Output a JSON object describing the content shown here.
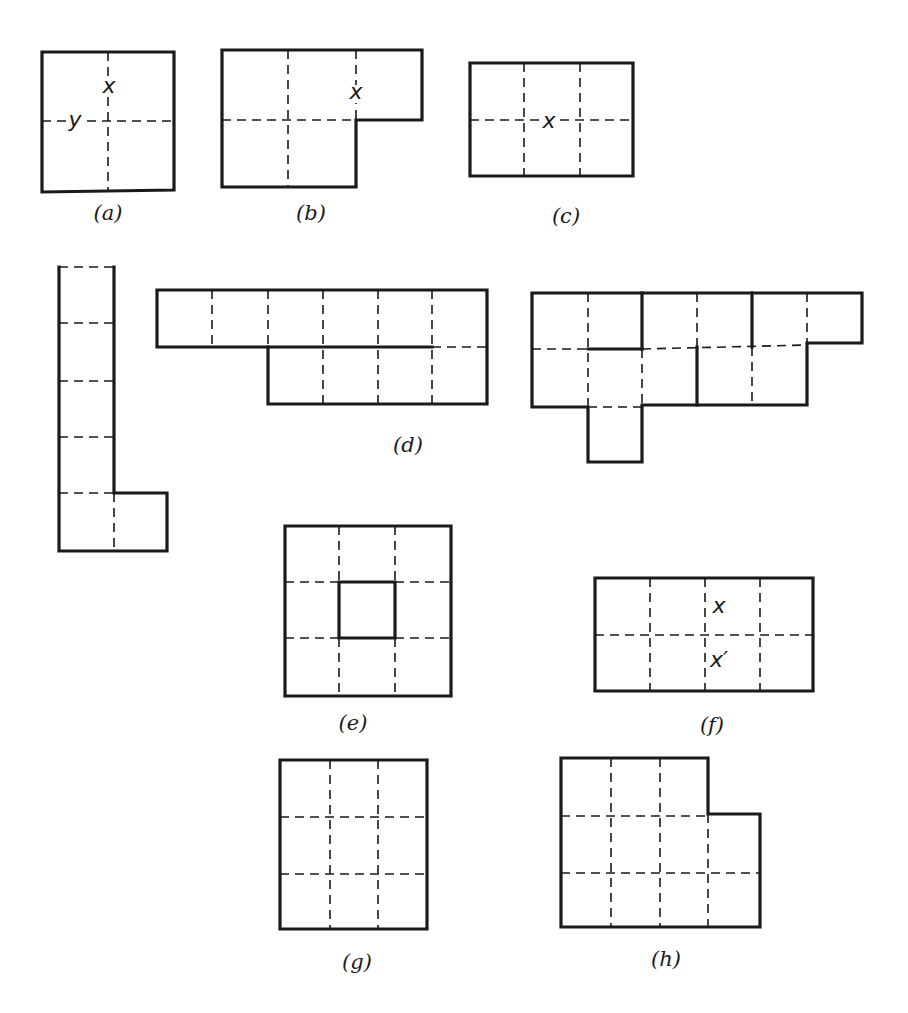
{
  "figures": [
    {
      "id": "a",
      "caption": "(a)",
      "caption_pos": [
        108,
        220
      ],
      "solid": [
        [
          [
            42,
            52
          ],
          [
            174,
            52
          ],
          [
            174,
            190
          ],
          [
            42,
            192
          ],
          [
            42,
            52
          ]
        ]
      ],
      "dashed": [
        [
          [
            108,
            52
          ],
          [
            108,
            190
          ]
        ],
        [
          [
            42,
            121
          ],
          [
            174,
            121
          ]
        ]
      ],
      "labels": [
        {
          "text": "x",
          "pos": [
            109,
            93
          ]
        },
        {
          "text": "y",
          "pos": [
            75,
            127
          ]
        }
      ]
    },
    {
      "id": "b",
      "caption": "(b)",
      "caption_pos": [
        311,
        220
      ],
      "solid": [
        [
          [
            222,
            50
          ],
          [
            422,
            50
          ],
          [
            422,
            120
          ],
          [
            356,
            120
          ],
          [
            356,
            187
          ],
          [
            222,
            187
          ],
          [
            222,
            50
          ]
        ]
      ],
      "dashed": [
        [
          [
            288,
            50
          ],
          [
            288,
            187
          ]
        ],
        [
          [
            356,
            50
          ],
          [
            356,
            120
          ]
        ],
        [
          [
            222,
            120
          ],
          [
            356,
            120
          ]
        ]
      ],
      "labels": [
        {
          "text": "x",
          "pos": [
            356,
            99
          ]
        }
      ]
    },
    {
      "id": "c",
      "caption": "(c)",
      "caption_pos": [
        566,
        223
      ],
      "solid": [
        [
          [
            470,
            63
          ],
          [
            633,
            63
          ],
          [
            633,
            176
          ],
          [
            470,
            176
          ],
          [
            470,
            63
          ]
        ]
      ],
      "dashed": [
        [
          [
            524,
            63
          ],
          [
            524,
            176
          ]
        ],
        [
          [
            580,
            63
          ],
          [
            580,
            176
          ]
        ],
        [
          [
            470,
            120
          ],
          [
            633,
            120
          ]
        ]
      ],
      "labels": [
        {
          "text": "x",
          "pos": [
            549,
            128
          ]
        }
      ]
    },
    {
      "id": "d-left",
      "caption": "",
      "solid": [
        [
          [
            59,
            267
          ],
          [
            59,
            551
          ],
          [
            167,
            551
          ],
          [
            167,
            493
          ],
          [
            114,
            493
          ],
          [
            114,
            267
          ]
        ]
      ],
      "dashed": [
        [
          [
            59,
            267
          ],
          [
            114,
            267
          ]
        ],
        [
          [
            59,
            323
          ],
          [
            114,
            323
          ]
        ],
        [
          [
            59,
            381
          ],
          [
            114,
            381
          ]
        ],
        [
          [
            59,
            437
          ],
          [
            114,
            437
          ]
        ],
        [
          [
            59,
            493
          ],
          [
            114,
            493
          ]
        ],
        [
          [
            114,
            493
          ],
          [
            114,
            551
          ]
        ]
      ],
      "labels": []
    },
    {
      "id": "d-middle",
      "caption": "(d)",
      "caption_pos": [
        408,
        452
      ],
      "solid": [
        [
          [
            157,
            290
          ],
          [
            487,
            290
          ],
          [
            487,
            404
          ],
          [
            268,
            404
          ],
          [
            268,
            347
          ],
          [
            157,
            347
          ],
          [
            157,
            290
          ]
        ],
        [
          [
            268,
            347
          ],
          [
            432,
            347
          ]
        ]
      ],
      "dashed": [
        [
          [
            212,
            290
          ],
          [
            212,
            347
          ]
        ],
        [
          [
            268,
            290
          ],
          [
            268,
            404
          ]
        ],
        [
          [
            323,
            290
          ],
          [
            323,
            404
          ]
        ],
        [
          [
            378,
            290
          ],
          [
            378,
            404
          ]
        ],
        [
          [
            432,
            290
          ],
          [
            432,
            404
          ]
        ],
        [
          [
            432,
            347
          ],
          [
            487,
            347
          ]
        ]
      ],
      "labels": []
    },
    {
      "id": "d-right",
      "caption": "",
      "solid": [
        [
          [
            532,
            293
          ],
          [
            862,
            293
          ],
          [
            862,
            343
          ],
          [
            807,
            343
          ],
          [
            807,
            405
          ],
          [
            642,
            405
          ],
          [
            642,
            462
          ],
          [
            588,
            462
          ],
          [
            588,
            407
          ],
          [
            532,
            407
          ],
          [
            532,
            293
          ]
        ],
        [
          [
            642,
            293
          ],
          [
            642,
            349
          ]
        ],
        [
          [
            588,
            349
          ],
          [
            642,
            349
          ]
        ],
        [
          [
            697,
            347
          ],
          [
            697,
            405
          ]
        ],
        [
          [
            752,
            293
          ],
          [
            752,
            347
          ]
        ]
      ],
      "dashed": [
        [
          [
            588,
            293
          ],
          [
            588,
            407
          ]
        ],
        [
          [
            697,
            293
          ],
          [
            697,
            347
          ]
        ],
        [
          [
            807,
            293
          ],
          [
            807,
            343
          ]
        ],
        [
          [
            532,
            349
          ],
          [
            588,
            349
          ]
        ],
        [
          [
            642,
            349
          ],
          [
            807,
            345
          ]
        ],
        [
          [
            642,
            349
          ],
          [
            642,
            405
          ]
        ],
        [
          [
            752,
            347
          ],
          [
            752,
            405
          ]
        ],
        [
          [
            588,
            407
          ],
          [
            642,
            407
          ]
        ]
      ],
      "labels": []
    },
    {
      "id": "e",
      "caption": "(e)",
      "caption_pos": [
        353,
        730
      ],
      "solid": [
        [
          [
            285,
            526
          ],
          [
            451,
            526
          ],
          [
            451,
            696
          ],
          [
            285,
            696
          ],
          [
            285,
            526
          ]
        ],
        [
          [
            339,
            582
          ],
          [
            395,
            582
          ],
          [
            395,
            638
          ],
          [
            339,
            638
          ],
          [
            339,
            582
          ]
        ]
      ],
      "dashed": [
        [
          [
            339,
            526
          ],
          [
            339,
            582
          ]
        ],
        [
          [
            395,
            526
          ],
          [
            395,
            582
          ]
        ],
        [
          [
            339,
            638
          ],
          [
            339,
            696
          ]
        ],
        [
          [
            395,
            638
          ],
          [
            395,
            696
          ]
        ],
        [
          [
            285,
            582
          ],
          [
            339,
            582
          ]
        ],
        [
          [
            395,
            582
          ],
          [
            451,
            582
          ]
        ],
        [
          [
            285,
            638
          ],
          [
            339,
            638
          ]
        ],
        [
          [
            395,
            638
          ],
          [
            451,
            638
          ]
        ]
      ],
      "labels": []
    },
    {
      "id": "f",
      "caption": "(f)",
      "caption_pos": [
        712,
        732
      ],
      "solid": [
        [
          [
            595,
            578
          ],
          [
            813,
            578
          ],
          [
            813,
            691
          ],
          [
            595,
            691
          ],
          [
            595,
            578
          ]
        ]
      ],
      "dashed": [
        [
          [
            650,
            578
          ],
          [
            650,
            691
          ]
        ],
        [
          [
            705,
            578
          ],
          [
            705,
            691
          ]
        ],
        [
          [
            760,
            578
          ],
          [
            760,
            691
          ]
        ],
        [
          [
            595,
            635
          ],
          [
            813,
            635
          ]
        ]
      ],
      "labels": [
        {
          "text": "x",
          "pos": [
            719,
            613
          ]
        },
        {
          "text": "x′",
          "pos": [
            719,
            667
          ]
        }
      ]
    },
    {
      "id": "g",
      "caption": "(g)",
      "caption_pos": [
        357,
        969
      ],
      "solid": [
        [
          [
            280,
            760
          ],
          [
            427,
            760
          ],
          [
            427,
            929
          ],
          [
            280,
            929
          ],
          [
            280,
            760
          ]
        ]
      ],
      "dashed": [
        [
          [
            330,
            760
          ],
          [
            330,
            929
          ]
        ],
        [
          [
            378,
            760
          ],
          [
            378,
            929
          ]
        ],
        [
          [
            280,
            817
          ],
          [
            427,
            817
          ]
        ],
        [
          [
            280,
            874
          ],
          [
            427,
            874
          ]
        ]
      ],
      "labels": []
    },
    {
      "id": "h",
      "caption": "(h)",
      "caption_pos": [
        666,
        966
      ],
      "solid": [
        [
          [
            561,
            758
          ],
          [
            708,
            758
          ],
          [
            708,
            814
          ],
          [
            760,
            814
          ],
          [
            760,
            927
          ],
          [
            561,
            927
          ],
          [
            561,
            758
          ]
        ]
      ],
      "dashed": [
        [
          [
            611,
            758
          ],
          [
            611,
            927
          ]
        ],
        [
          [
            660,
            758
          ],
          [
            660,
            927
          ]
        ],
        [
          [
            708,
            814
          ],
          [
            708,
            927
          ]
        ],
        [
          [
            561,
            816
          ],
          [
            708,
            816
          ]
        ],
        [
          [
            561,
            873
          ],
          [
            760,
            873
          ]
        ]
      ],
      "labels": []
    }
  ]
}
